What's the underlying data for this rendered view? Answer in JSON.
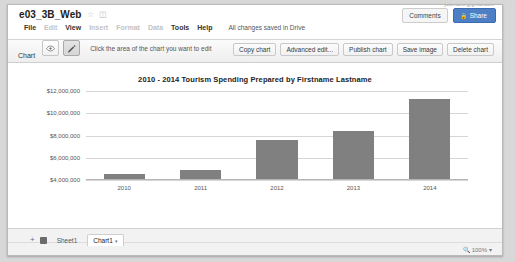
{
  "header": {
    "doc_title": "e03_3B_Web",
    "star_icon": "star-icon",
    "folder_icon": "folder-icon",
    "account_line": "yourname@gmail.com",
    "menus": [
      {
        "label": "File",
        "enabled": true
      },
      {
        "label": "Edit",
        "enabled": false
      },
      {
        "label": "View",
        "enabled": true
      },
      {
        "label": "Insert",
        "enabled": false
      },
      {
        "label": "Format",
        "enabled": false
      },
      {
        "label": "Data",
        "enabled": false
      },
      {
        "label": "Tools",
        "enabled": true
      },
      {
        "label": "Help",
        "enabled": true
      }
    ],
    "save_state": "All changes saved in Drive",
    "comments_label": "Comments",
    "share_label": "Share",
    "share_color": "#4d7fc4"
  },
  "toolbar": {
    "chart_label": "Chart",
    "eye_icon": "eye-icon",
    "pencil_icon": "pencil-icon",
    "hint": "Click the area of the chart you want to edit",
    "buttons": [
      "Copy chart",
      "Advanced edit...",
      "Publish chart",
      "Save image",
      "Delete chart"
    ]
  },
  "chart_data": {
    "type": "bar",
    "title": "2010 - 2014 Tourism Spending Prepared by Firstname Lastname",
    "categories": [
      "2010",
      "2011",
      "2012",
      "2013",
      "2014"
    ],
    "values": [
      4500000,
      4900000,
      7600000,
      8450000,
      11250000
    ],
    "ticks": [
      "$12,000,000",
      "$10,000,000",
      "$8,000,000",
      "$6,000,000",
      "$4,000,000"
    ],
    "tick_values": [
      12000000,
      10000000,
      8000000,
      6000000,
      4000000
    ],
    "ylim": [
      4000000,
      12000000
    ],
    "xlabel": "",
    "ylabel": "",
    "grid": true,
    "legend": "none",
    "bar_color": "#808080"
  },
  "bottom": {
    "add_sheet_icon": "add-sheet-icon",
    "all_sheets_icon": "all-sheets-icon",
    "tabs": [
      {
        "label": "Sheet1",
        "active": false
      },
      {
        "label": "Chart1",
        "active": true
      }
    ],
    "tab_caret": "▾",
    "zoom_icon": "magnifier-icon",
    "zoom_level": "100%",
    "zoom_caret": "▾"
  }
}
